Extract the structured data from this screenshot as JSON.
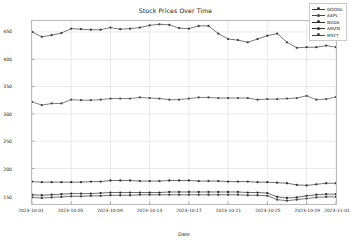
{
  "chart": {
    "title": "Stock Prices Over Time",
    "xlabel": "Date",
    "ylabel": "Stock Price (USD)"
  },
  "axis": {
    "yticks": [
      "450",
      "400",
      "350",
      "300",
      "250",
      "200",
      "150"
    ],
    "xticks": [
      "2023-10-01",
      "2023-10-05",
      "2023-10-09",
      "2023-10-13",
      "2023-10-17",
      "2023-10-21",
      "2023-10-25",
      "2023-10-29",
      "2023-11-01"
    ]
  },
  "legend": {
    "position": "upper-right",
    "entries": [
      {
        "label": "GOOGL",
        "color": "#3b3b3b"
      },
      {
        "label": "AAPL",
        "color": "#4a4a4a"
      },
      {
        "label": "NVDA",
        "color": "#333333"
      },
      {
        "label": "AMZN",
        "color": "#2e2e2e"
      },
      {
        "label": "MSFT",
        "color": "#404040"
      }
    ]
  },
  "chart_data": {
    "type": "line",
    "title": "Stock Prices Over Time",
    "xlabel": "Date",
    "ylabel": "Stock Price (USD)",
    "grid": true,
    "legend_position": "upper right",
    "marker": "circle",
    "ylim": [
      135,
      470
    ],
    "xlim": [
      "2023-10-01",
      "2023-11-01"
    ],
    "x": [
      "2023-10-01",
      "2023-10-02",
      "2023-10-03",
      "2023-10-04",
      "2023-10-05",
      "2023-10-06",
      "2023-10-07",
      "2023-10-08",
      "2023-10-09",
      "2023-10-10",
      "2023-10-11",
      "2023-10-12",
      "2023-10-13",
      "2023-10-14",
      "2023-10-15",
      "2023-10-16",
      "2023-10-17",
      "2023-10-18",
      "2023-10-19",
      "2023-10-20",
      "2023-10-21",
      "2023-10-22",
      "2023-10-23",
      "2023-10-24",
      "2023-10-25",
      "2023-10-26",
      "2023-10-27",
      "2023-10-28",
      "2023-10-29",
      "2023-10-30",
      "2023-10-31",
      "2023-11-01"
    ],
    "series": [
      {
        "name": "GOOGL",
        "color": "#3b3b3b",
        "values": [
          450,
          441,
          444,
          448,
          456,
          455,
          454,
          454,
          458,
          455,
          456,
          458,
          462,
          464,
          463,
          457,
          456,
          461,
          461,
          447,
          437,
          435,
          431,
          437,
          443,
          447,
          431,
          421,
          422,
          422,
          425,
          422
        ]
      },
      {
        "name": "AAPL",
        "color": "#4a4a4a",
        "values": [
          322,
          316,
          319,
          319,
          326,
          325,
          325,
          326,
          328,
          328,
          328,
          330,
          329,
          328,
          326,
          326,
          328,
          330,
          330,
          329,
          329,
          329,
          329,
          326,
          327,
          327,
          328,
          329,
          333,
          326,
          327,
          331
        ]
      },
      {
        "name": "NVDA",
        "color": "#333333",
        "values": [
          176,
          175,
          175,
          175,
          175,
          175,
          176,
          176,
          178,
          178,
          178,
          177,
          177,
          177,
          178,
          178,
          178,
          177,
          177,
          177,
          176,
          176,
          176,
          175,
          175,
          174,
          173,
          170,
          169,
          171,
          173,
          173
        ]
      },
      {
        "name": "AMZN",
        "color": "#2e2e2e",
        "values": [
          152,
          151,
          152,
          153,
          154,
          154,
          154,
          155,
          156,
          156,
          156,
          156,
          156,
          156,
          157,
          157,
          157,
          157,
          157,
          157,
          157,
          157,
          156,
          156,
          155,
          148,
          146,
          147,
          150,
          152,
          153,
          153
        ]
      },
      {
        "name": "MSFT",
        "color": "#404040",
        "values": [
          147,
          146,
          147,
          148,
          149,
          149,
          150,
          150,
          151,
          151,
          151,
          152,
          152,
          152,
          152,
          152,
          152,
          152,
          152,
          152,
          152,
          152,
          151,
          151,
          150,
          143,
          141,
          143,
          145,
          147,
          148,
          148
        ]
      }
    ]
  },
  "style": {
    "grid_color": "#dcdcdc",
    "axes_color": "#b9b9b9",
    "background": "#ffffff"
  }
}
